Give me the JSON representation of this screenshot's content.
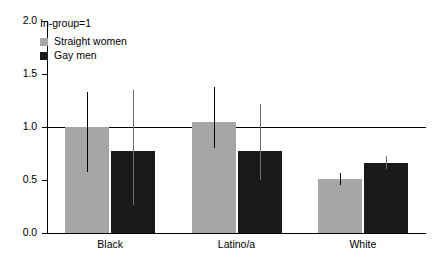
{
  "chart_data": {
    "type": "bar",
    "title": "",
    "annotation": "In-group=1",
    "xlabel": "",
    "ylabel": "",
    "categories": [
      "Black",
      "Latino/a",
      "White"
    ],
    "ylim": [
      0.0,
      2.0
    ],
    "yticks": [
      "0.0",
      "0.5",
      "1.0",
      "1.5",
      "2.0"
    ],
    "ytick_values": [
      0.0,
      0.5,
      1.0,
      1.5,
      2.0
    ],
    "grid": false,
    "reference_line": 1.0,
    "legend_position": "top-left",
    "series": [
      {
        "name": "Straight women",
        "color": "#a6a6a6",
        "values": [
          1.0,
          1.05,
          0.51
        ],
        "error_low": [
          0.58,
          0.8,
          0.45
        ],
        "error_high": [
          1.33,
          1.38,
          0.57
        ]
      },
      {
        "name": "Gay men",
        "color": "#1a1a1a",
        "values": [
          0.77,
          0.77,
          0.66
        ],
        "error_low": [
          0.26,
          0.5,
          0.6
        ],
        "error_high": [
          1.35,
          1.22,
          0.73
        ]
      }
    ]
  },
  "legend": {
    "title": "In-group=1",
    "entries": [
      {
        "label": "Straight women",
        "color": "#a6a6a6"
      },
      {
        "label": "Gay men",
        "color": "#1a1a1a"
      }
    ]
  },
  "axis": {
    "y_labels": [
      "2.0",
      "1.5",
      "1.0",
      "0.5",
      "0.0"
    ],
    "x_labels": [
      "Black",
      "Latino/a",
      "White"
    ]
  }
}
